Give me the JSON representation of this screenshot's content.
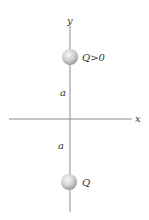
{
  "diagram": {
    "axes": {
      "x_label": "x",
      "y_label": "y"
    },
    "charges": [
      {
        "label": "Q>0",
        "position": "top"
      },
      {
        "label": "Q",
        "position": "bottom"
      }
    ],
    "distances": [
      {
        "label": "a",
        "segment": "origin-to-top"
      },
      {
        "label": "a",
        "segment": "origin-to-bottom"
      }
    ],
    "colors": {
      "line": "#8a8a8a",
      "sphere_light": "#f2f2f2",
      "sphere_dark": "#a8a8a8"
    }
  }
}
